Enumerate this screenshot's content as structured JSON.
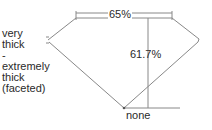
{
  "diagram": {
    "type": "diamond-proportions",
    "girdle": {
      "label_lines": [
        "very",
        "thick",
        "-",
        "extremely",
        "thick",
        "(faceted)"
      ]
    },
    "table": {
      "label": "65%"
    },
    "depth": {
      "label": "61.7%"
    },
    "culet": {
      "label": "none"
    },
    "colors": {
      "line": "#777777",
      "text": "#2a2a2a"
    }
  }
}
